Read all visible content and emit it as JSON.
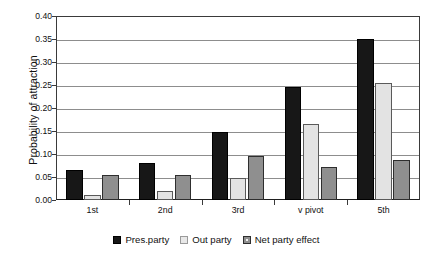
{
  "chart_data": {
    "type": "bar",
    "title": "",
    "xlabel": "",
    "ylabel": "Probability of attraction",
    "ylim": [
      0,
      0.4
    ],
    "ytick_step": 0.05,
    "ytick_labels": [
      "0.00",
      "0.05",
      "0.10",
      "0.15",
      "0.20",
      "0.25",
      "0.30",
      "0.35",
      "0.40"
    ],
    "ytick_values": [
      0,
      0.05,
      0.1,
      0.15,
      0.2,
      0.25,
      0.3,
      0.35,
      0.4
    ],
    "grid": true,
    "legend_position": "bottom",
    "categories": [
      "1st",
      "2nd",
      "3rd",
      "v pivot",
      "5th"
    ],
    "series": [
      {
        "name": "Pres.party",
        "color": "#171717",
        "values": [
          0.065,
          0.08,
          0.148,
          0.245,
          0.35
        ]
      },
      {
        "name": "Out party",
        "color": "#e3e3e3",
        "values": [
          0.01,
          0.02,
          0.048,
          0.165,
          0.255
        ]
      },
      {
        "name": "Net party effect",
        "color": "#8f8f8f",
        "values": [
          0.055,
          0.055,
          0.095,
          0.072,
          0.088
        ]
      }
    ]
  }
}
